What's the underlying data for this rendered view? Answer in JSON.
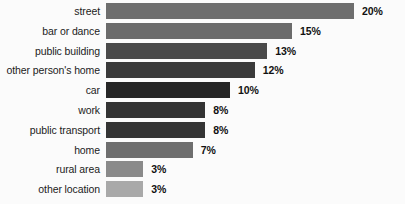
{
  "chart_data": {
    "type": "bar",
    "orientation": "horizontal",
    "title": "",
    "subtitle": "",
    "xlabel": "",
    "ylabel": "",
    "grid": false,
    "legend": null,
    "axis_visible": false,
    "xlim": [
      0,
      20
    ],
    "unit": "%",
    "categories": [
      "street",
      "bar or dance",
      "public building",
      "other person's home",
      "car",
      "work",
      "public transport",
      "home",
      "rural area",
      "other location"
    ],
    "values": [
      20,
      15,
      13,
      12,
      10,
      8,
      8,
      7,
      3,
      3
    ],
    "value_labels": [
      "20%",
      "15%",
      "13%",
      "12%",
      "10%",
      "8%",
      "8%",
      "7%",
      "3%",
      "3%"
    ],
    "bar_colors": [
      "#6e6e6e",
      "#6b6b6b",
      "#4a4a4a",
      "#3a3a3a",
      "#262626",
      "#333333",
      "#343434",
      "#6e6e6e",
      "#8a8a8a",
      "#a9a9a9"
    ],
    "background_color": "#fbfbfb",
    "label_color": "#1b1b1b",
    "value_label_color": "#111111"
  }
}
